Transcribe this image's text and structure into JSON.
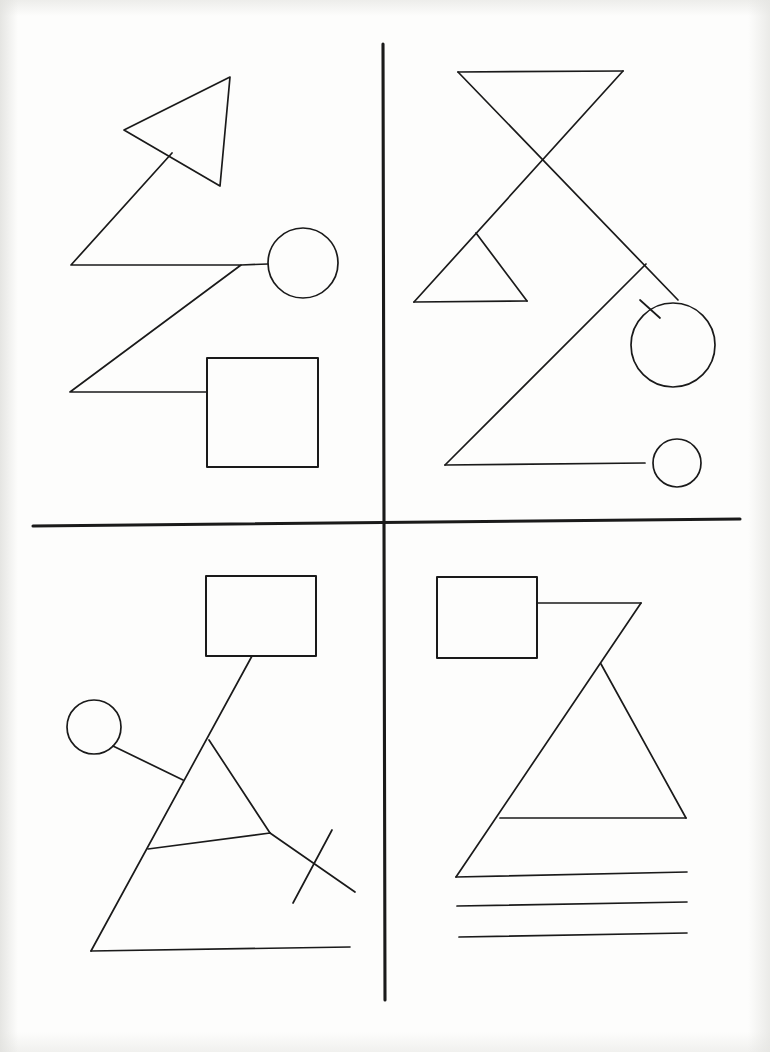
{
  "document": {
    "kind": "line-drawing",
    "title": "Four-quadrant geometric line drawing",
    "background_color": "#fdfdfc",
    "ink_color": "#1a1a1a",
    "width": 770,
    "height": 1052
  },
  "dividers": {
    "vertical": {
      "name": "vertical-divider",
      "x1": 383,
      "y1": 44,
      "x2": 385,
      "y2": 1000,
      "stroke_width": 3.1
    },
    "horizontal": {
      "name": "horizontal-divider",
      "x1": 33,
      "y1": 526,
      "x2": 740,
      "y2": 519,
      "stroke_width": 3.1
    }
  },
  "quadrants": [
    {
      "id": "top-left",
      "label": "Top Left",
      "shapes": [
        {
          "name": "triangle-outline",
          "type": "polygon",
          "points": "230,77 124,130 220,186"
        },
        {
          "name": "zigzag-polyline",
          "type": "polyline",
          "points": "172,153 71,265 241,265 70,392 207,392"
        },
        {
          "name": "connector-line-to-circle",
          "type": "line",
          "points": "241,265 268,264"
        },
        {
          "name": "circle-outline",
          "type": "circle",
          "cx": 303,
          "cy": 263,
          "r": 35
        },
        {
          "name": "square-outline",
          "type": "rect",
          "x": 207,
          "y": 358,
          "width": 111,
          "height": 109
        }
      ]
    },
    {
      "id": "top-right",
      "label": "Top Right",
      "shapes": [
        {
          "name": "bowtie-top-bar",
          "type": "line",
          "points": "458,72 623,71"
        },
        {
          "name": "bowtie-left-diagonal",
          "type": "line",
          "points": "458,72 678,300"
        },
        {
          "name": "bowtie-right-diagonal",
          "type": "line",
          "points": "623,71 414,302"
        },
        {
          "name": "small-triangle-base",
          "type": "line",
          "points": "414,302 527,301"
        },
        {
          "name": "small-triangle-right-edge",
          "type": "line",
          "points": "476,233 527,301"
        },
        {
          "name": "large-triangle-left-edge",
          "type": "line",
          "points": "646,264 445,465"
        },
        {
          "name": "large-triangle-base",
          "type": "line",
          "points": "445,465 645,463"
        },
        {
          "name": "connector-line-to-large-circle",
          "type": "line",
          "points": "640,300 660,318"
        },
        {
          "name": "large-circle-outline",
          "type": "circle",
          "cx": 673,
          "cy": 345,
          "r": 42
        },
        {
          "name": "small-circle-outline",
          "type": "circle",
          "cx": 677,
          "cy": 463,
          "r": 24
        }
      ]
    },
    {
      "id": "bottom-left",
      "label": "Bottom Left",
      "shapes": [
        {
          "name": "rectangle-outline",
          "type": "rect",
          "x": 206,
          "y": 576,
          "width": 110,
          "height": 80
        },
        {
          "name": "main-diagonal-line",
          "type": "line",
          "points": "252,656 91,951"
        },
        {
          "name": "baseline-line",
          "type": "line",
          "points": "91,951 350,947"
        },
        {
          "name": "circle-outline",
          "type": "circle",
          "cx": 94,
          "cy": 727,
          "r": 27
        },
        {
          "name": "circle-connector-line",
          "type": "line",
          "points": "113,746 183,780"
        },
        {
          "name": "inner-triangle-right-edge",
          "type": "line",
          "points": "209,740 270,833"
        },
        {
          "name": "inner-triangle-base",
          "type": "line",
          "points": "148,849 270,833"
        },
        {
          "name": "tail-line",
          "type": "line",
          "points": "270,833 355,892"
        },
        {
          "name": "cross-stroke-line",
          "type": "line",
          "points": "332,830 293,903"
        }
      ]
    },
    {
      "id": "bottom-right",
      "label": "Bottom Right",
      "shapes": [
        {
          "name": "rectangle-outline",
          "type": "rect",
          "x": 437,
          "y": 577,
          "width": 100,
          "height": 81
        },
        {
          "name": "top-connector-line",
          "type": "line",
          "points": "537,603 641,603"
        },
        {
          "name": "triangle-left-edge",
          "type": "line",
          "points": "641,603 456,877"
        },
        {
          "name": "triangle-apex-right-edge",
          "type": "line",
          "points": "601,664 686,818"
        },
        {
          "name": "triangle-crossbar-line",
          "type": "line",
          "points": "500,818 686,818"
        },
        {
          "name": "baseline-line-1",
          "type": "line",
          "points": "456,877 687,872"
        },
        {
          "name": "baseline-line-2",
          "type": "line",
          "points": "457,906 687,902"
        },
        {
          "name": "baseline-line-3",
          "type": "line",
          "points": "459,937 687,933"
        }
      ]
    }
  ]
}
